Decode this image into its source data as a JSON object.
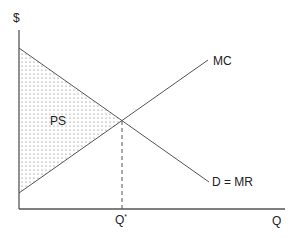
{
  "diagram": {
    "axes": {
      "y_label": "$",
      "x_label": "Q"
    },
    "curves": {
      "marginal_cost": {
        "label": "MC"
      },
      "demand": {
        "label": "D = MR"
      }
    },
    "equilibrium": {
      "quantity_label": "Q",
      "quantity_superscript": "*"
    },
    "regions": {
      "producer_surplus": {
        "label": "PS",
        "fill_pattern": "dotted"
      }
    },
    "colors": {
      "line": "#555555",
      "text": "#222222",
      "dots": "#666666"
    }
  }
}
